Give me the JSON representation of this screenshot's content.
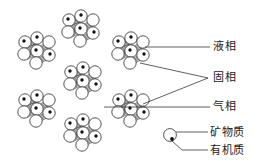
{
  "figure": {
    "type": "soil-three-phase-structure-diagram",
    "background_color": "#ffffff",
    "line_color": "#2b2b2b",
    "dot_color": "#111111",
    "particle_fill": "#ffffff"
  },
  "labels": {
    "liquid_phase": "液相",
    "solid_phase": "固相",
    "gas_phase": "气相",
    "mineral": "矿物质",
    "organic": "有机质"
  },
  "legend": {
    "mineral_symbol": "open-circle",
    "organic_symbol": "small-filled-dot",
    "mineral_label": "矿物质",
    "organic_label": "有机质"
  },
  "clusters": [
    {
      "id": "cluster-top-left",
      "cx": 38,
      "cy": 50
    },
    {
      "id": "cluster-top-center",
      "cx": 82,
      "cy": 28
    },
    {
      "id": "cluster-top-right",
      "cx": 132,
      "cy": 50
    },
    {
      "id": "cluster-mid-center",
      "cx": 84,
      "cy": 80
    },
    {
      "id": "cluster-bottom-left",
      "cx": 38,
      "cy": 108
    },
    {
      "id": "cluster-bottom-center",
      "cx": 84,
      "cy": 132
    },
    {
      "id": "cluster-bottom-right",
      "cx": 132,
      "cy": 108
    }
  ],
  "leader_lines": [
    {
      "id": "leader-liquid",
      "from_x": 145,
      "from_y": 47,
      "to_x": 210,
      "to_y": 47
    },
    {
      "id": "leader-solid-upper",
      "from_x": 140,
      "from_y": 63,
      "to_x": 208,
      "to_y": 78
    },
    {
      "id": "leader-solid-lower",
      "from_x": 143,
      "from_y": 104,
      "to_x": 208,
      "to_y": 78
    },
    {
      "id": "leader-gas",
      "from_x": 106,
      "from_y": 107,
      "to_x": 210,
      "to_y": 107
    },
    {
      "id": "leader-mineral",
      "from_x": 176,
      "from_y": 133,
      "to_x": 208,
      "to_y": 133
    },
    {
      "id": "leader-organic",
      "from_x": 173,
      "from_y": 142,
      "to_x": 208,
      "to_y": 151
    }
  ]
}
